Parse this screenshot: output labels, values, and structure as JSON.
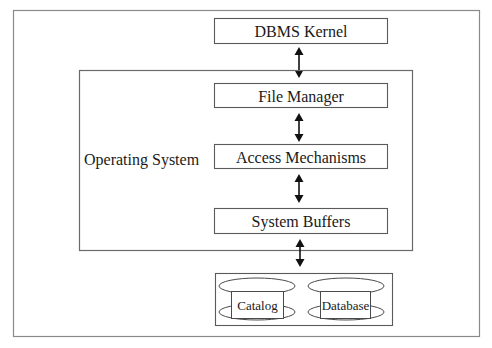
{
  "diagram": {
    "type": "layered-architecture",
    "container_label": "Operating System",
    "layers": [
      {
        "id": "dbms-kernel",
        "label": "DBMS Kernel"
      },
      {
        "id": "file-manager",
        "label": "File Manager"
      },
      {
        "id": "access-mechanisms",
        "label": "Access Mechanisms"
      },
      {
        "id": "system-buffers",
        "label": "System Buffers"
      }
    ],
    "storage": [
      {
        "id": "catalog",
        "label": "Catalog",
        "shape": "cylinder"
      },
      {
        "id": "database",
        "label": "Database",
        "shape": "cylinder"
      }
    ],
    "connections": [
      {
        "from": "DBMS Kernel",
        "to": "File Manager",
        "direction": "bidirectional"
      },
      {
        "from": "File Manager",
        "to": "Access Mechanisms",
        "direction": "bidirectional"
      },
      {
        "from": "Access Mechanisms",
        "to": "System Buffers",
        "direction": "bidirectional"
      },
      {
        "from": "System Buffers",
        "to": "Storage",
        "direction": "bidirectional"
      }
    ],
    "colors": {
      "stroke": "#5a5a5a",
      "text": "#1a1a1a",
      "arrow": "#111111",
      "background": "#ffffff"
    }
  }
}
